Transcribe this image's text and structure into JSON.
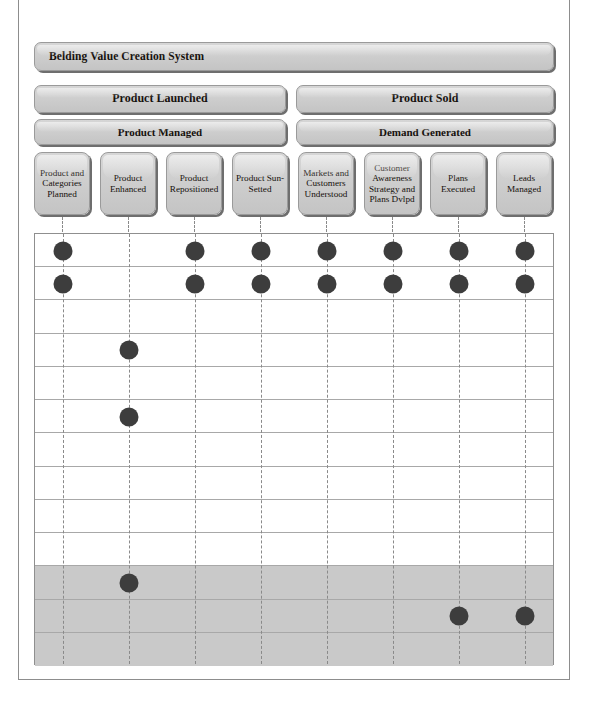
{
  "diagram": {
    "title": "Belding Value Creation System",
    "level2": [
      {
        "label": "Product Launched"
      },
      {
        "label": "Product Sold"
      }
    ],
    "level3": [
      {
        "label": "Product Managed"
      },
      {
        "label": "Demand Generated"
      }
    ],
    "columns": [
      {
        "label": "Product and Categories Planned"
      },
      {
        "label": "Product Enhanced"
      },
      {
        "label": "Product Repositioned"
      },
      {
        "label": "Product Sun-Setted"
      },
      {
        "label": "Markets and Customers Understood"
      },
      {
        "label": "Customer Awareness Strategy and Plans Dvlpd"
      },
      {
        "label": "Plans Executed"
      },
      {
        "label": "Leads Managed"
      }
    ]
  },
  "chart_data": {
    "type": "table",
    "title": "Belding Value Creation System",
    "categories": [
      "Product and Categories Planned",
      "Product Enhanced",
      "Product Repositioned",
      "Product Sun-Setted",
      "Markets and Customers Understood",
      "Customer Awareness Strategy and Plans Dvlpd",
      "Plans Executed",
      "Leads Managed"
    ],
    "row_count": 13,
    "shaded_rows": [
      11,
      12,
      13
    ],
    "grid": "on",
    "xlabel": "",
    "ylabel": "",
    "markers": [
      {
        "row": 1,
        "columns": [
          1,
          3,
          4,
          5,
          6,
          7,
          8
        ]
      },
      {
        "row": 2,
        "columns": [
          1,
          3,
          4,
          5,
          6,
          7,
          8
        ]
      },
      {
        "row": 3,
        "columns": []
      },
      {
        "row": 4,
        "columns": [
          2
        ]
      },
      {
        "row": 5,
        "columns": []
      },
      {
        "row": 6,
        "columns": [
          2
        ]
      },
      {
        "row": 7,
        "columns": []
      },
      {
        "row": 8,
        "columns": []
      },
      {
        "row": 9,
        "columns": []
      },
      {
        "row": 10,
        "columns": []
      },
      {
        "row": 11,
        "columns": [
          2
        ]
      },
      {
        "row": 12,
        "columns": [
          7,
          8
        ]
      },
      {
        "row": 13,
        "columns": []
      }
    ],
    "colors": {
      "marker": "#3d3d3d",
      "shaded_row": "#c9c9c9",
      "box_fill": "#cfcfcf",
      "box_border": "#9a9a9a",
      "grid_line": "#a8a8a8"
    }
  }
}
